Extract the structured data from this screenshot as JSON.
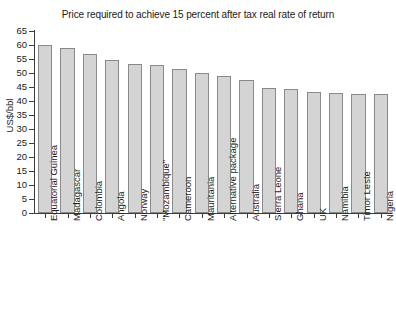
{
  "chart_data": {
    "type": "bar",
    "title": "Price required to achieve 15 percent after tax real rate of return",
    "xlabel": "",
    "ylabel": "US$/bbl",
    "ylim": [
      0,
      65
    ],
    "yticks": [
      0,
      5,
      10,
      15,
      20,
      25,
      30,
      35,
      40,
      45,
      50,
      55,
      60,
      65
    ],
    "grid": false,
    "legend": null,
    "categories": [
      "Equatorial Guinea",
      "Madagascar",
      "Colombia",
      "Angola",
      "Norway",
      "\"Mozambique\"",
      "Cameroon",
      "Mauritania",
      "Alternative package",
      "Australia",
      "Sierra Leone",
      "Ghana",
      "UK",
      "Namibia",
      "Timor Leste",
      "Nigeria"
    ],
    "values": [
      60.0,
      58.9,
      56.6,
      54.5,
      53.2,
      52.7,
      51.4,
      49.8,
      48.9,
      47.4,
      44.5,
      44.3,
      43.3,
      42.7,
      42.6,
      42.3
    ],
    "colors": {
      "bar_fill": "#d4d4d4",
      "bar_border": "#8a8a8a",
      "axis": "#3c3c3c",
      "text": "#1a1a1a",
      "background": "#ffffff"
    }
  }
}
